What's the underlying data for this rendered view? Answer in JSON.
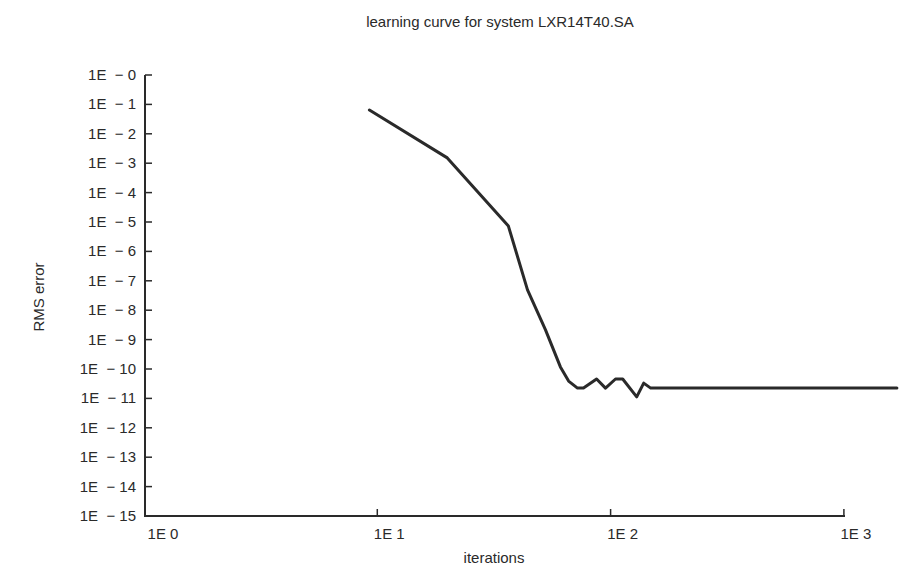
{
  "chart_data": {
    "type": "line",
    "title": "learning curve for system LXR14T40.SA",
    "xlabel": "iterations",
    "ylabel": "RMS error",
    "xscale": "log",
    "yscale": "log",
    "xlim": [
      1,
      1000
    ],
    "ylim": [
      1e-15,
      1
    ],
    "grid": false,
    "x_ticks": [
      "1E 0",
      "1E 1",
      "1E 2",
      "1E 3"
    ],
    "y_ticks": [
      "1E  − 0",
      "1E  − 1",
      "1E  − 2",
      "1E  − 3",
      "1E  − 4",
      "1E  − 5",
      "1E  − 6",
      "1E  − 7",
      "1E  − 8",
      "1E  − 9",
      "1E  − 10",
      "1E  − 11",
      "1E  − 12",
      "1E  − 13",
      "1E  − 14",
      "1E  − 15"
    ],
    "series": [
      {
        "name": "RMS error",
        "log10_points": [
          [
            0.966,
            -1.19
          ],
          [
            1.3,
            -2.82
          ],
          [
            1.562,
            -5.14
          ],
          [
            1.644,
            -7.31
          ],
          [
            1.721,
            -8.67
          ],
          [
            1.785,
            -9.93
          ],
          [
            1.82,
            -10.41
          ],
          [
            1.858,
            -10.65
          ],
          [
            1.884,
            -10.65
          ],
          [
            1.94,
            -10.34
          ],
          [
            1.978,
            -10.65
          ],
          [
            2.021,
            -10.34
          ],
          [
            2.052,
            -10.34
          ],
          [
            2.112,
            -10.95
          ],
          [
            2.142,
            -10.48
          ],
          [
            2.172,
            -10.65
          ],
          [
            3.227,
            -10.65
          ]
        ]
      }
    ]
  }
}
